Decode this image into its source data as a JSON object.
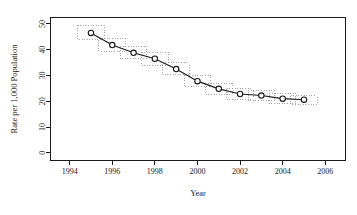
{
  "chart_data": {
    "type": "line",
    "title": "",
    "xlabel": "Year",
    "ylabel": "Rate per 1,000 Population",
    "x": [
      1995,
      1996,
      1997,
      1998,
      1999,
      2000,
      2001,
      2002,
      2003,
      2004,
      2005
    ],
    "values": [
      46.5,
      41.8,
      38.8,
      36.5,
      32.5,
      27.8,
      24.8,
      22.8,
      22.2,
      21.0,
      20.6
    ],
    "ci_lower": [
      44.0,
      39.5,
      36.5,
      34.0,
      30.2,
      25.6,
      22.8,
      20.8,
      20.3,
      19.2,
      18.8
    ],
    "ci_upper": [
      49.5,
      44.2,
      41.2,
      39.0,
      34.9,
      30.0,
      26.9,
      24.8,
      24.1,
      22.9,
      22.4
    ],
    "xticks": [
      1994,
      1996,
      1998,
      2000,
      2002,
      2004,
      2006
    ],
    "xticklabels": [
      "1994",
      "1996",
      "1998",
      "2000",
      "2002",
      "2004",
      "2006"
    ],
    "yticks": [
      0,
      10,
      20,
      30,
      40,
      50
    ],
    "yticklabels": [
      "0",
      "10",
      "20",
      "30",
      "40",
      "50"
    ],
    "xlim": [
      1993.1,
      2006.95
    ],
    "ylim": [
      -3.0,
      52.5
    ],
    "grid": false,
    "legend": null,
    "marker": "open-circle",
    "line_color": "#1a1a1a",
    "ci_color": "#8a8a8a",
    "ci_style": "dotted-rectangle"
  }
}
